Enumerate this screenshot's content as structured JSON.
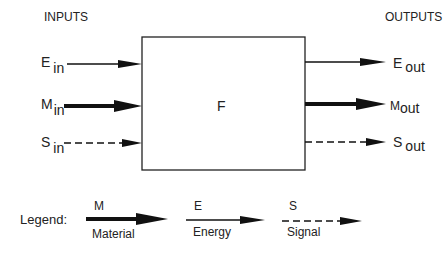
{
  "diagram": {
    "inputs_header": "INPUTS",
    "outputs_header": "OUTPUTS",
    "function_label": "F",
    "inputs": [
      {
        "symbol": "E",
        "subscript": "in",
        "flow": "energy"
      },
      {
        "symbol": "M",
        "subscript": "in",
        "flow": "material"
      },
      {
        "symbol": "S",
        "subscript": "in",
        "flow": "signal"
      }
    ],
    "outputs": [
      {
        "symbol": "E",
        "subscript": "out",
        "flow": "energy"
      },
      {
        "symbol": "M",
        "subscript": "out",
        "flow": "material"
      },
      {
        "symbol": "S",
        "subscript": "out",
        "flow": "signal"
      }
    ],
    "legend": {
      "title": "Legend:",
      "items": [
        {
          "symbol": "M",
          "name": "Material",
          "style": "thick-solid"
        },
        {
          "symbol": "E",
          "name": "Energy",
          "style": "thin-solid"
        },
        {
          "symbol": "S",
          "name": "Signal",
          "style": "dashed"
        }
      ]
    },
    "colors": {
      "stroke": "#111111",
      "background": "#ffffff"
    }
  }
}
